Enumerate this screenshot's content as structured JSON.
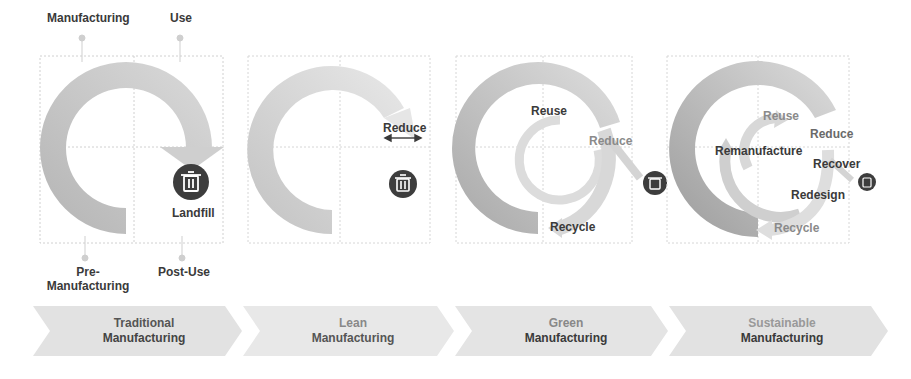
{
  "stage1": {
    "labels": {
      "manufacturing": "Manufacturing",
      "use": "Use",
      "pre_manufacturing": "Pre-\nManufacturing",
      "pre_line1": "Pre-",
      "pre_line2": "Manufacturing",
      "post_use": "Post-Use",
      "landfill": "Landfill"
    },
    "icon": "trash-icon"
  },
  "stage2": {
    "labels": {
      "reduce": "Reduce"
    },
    "icon": "trash-icon",
    "arrow": "double-arrow-icon"
  },
  "stage3": {
    "labels": {
      "reuse": "Reuse",
      "reduce": "Reduce",
      "recycle": "Recycle"
    },
    "icon": "trash-icon"
  },
  "stage4": {
    "labels": {
      "reuse": "Reuse",
      "reduce": "Reduce",
      "remanufacture": "Remanufacture",
      "recover": "Recover",
      "redesign": "Redesign",
      "recycle": "Recycle"
    },
    "icon": "trash-icon"
  },
  "chevrons": [
    {
      "line1": "Traditional",
      "line2": "Manufacturing"
    },
    {
      "line1": "Lean",
      "line2": "Manufacturing"
    },
    {
      "line1": "Green",
      "line2": "Manufacturing"
    },
    {
      "line1": "Sustainable",
      "line2": "Manufacturing"
    }
  ],
  "colors": {
    "ring_dark": "#a9a9a9",
    "ring_mid": "#c4c4c4",
    "ring_light": "#dcdcdc",
    "icon_circle": "#3d3d3d",
    "chevron_fill": "#e3e3e3",
    "text_dark": "#3a3a3a",
    "text_light": "#8a8a8a"
  }
}
